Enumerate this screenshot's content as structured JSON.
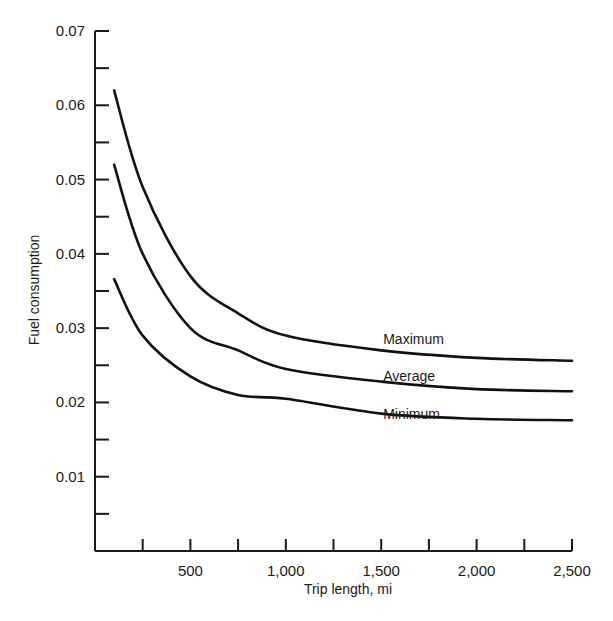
{
  "chart_data": {
    "type": "line",
    "title": "",
    "xlabel": "Trip length, mi",
    "ylabel": "Fuel consumption",
    "xlim": [
      0,
      2500
    ],
    "ylim": [
      0,
      0.07
    ],
    "grid": false,
    "legend": "inline labels at right end of curves",
    "x_ticks": [
      250,
      500,
      750,
      1000,
      1250,
      1500,
      1750,
      2000,
      2250,
      2500
    ],
    "x_tick_labels": [
      {
        "value": 500,
        "label": "500"
      },
      {
        "value": 1000,
        "label": "1,000"
      },
      {
        "value": 1500,
        "label": "1,500"
      },
      {
        "value": 2000,
        "label": "2,000"
      },
      {
        "value": 2500,
        "label": "2,500"
      }
    ],
    "y_ticks": [
      0.005,
      0.01,
      0.015,
      0.02,
      0.025,
      0.03,
      0.035,
      0.04,
      0.045,
      0.05,
      0.055,
      0.06,
      0.065,
      0.07
    ],
    "y_tick_labels": [
      {
        "value": 0.01,
        "label": "0.01"
      },
      {
        "value": 0.02,
        "label": "0.02"
      },
      {
        "value": 0.03,
        "label": "0.03"
      },
      {
        "value": 0.04,
        "label": "0.04"
      },
      {
        "value": 0.05,
        "label": "0.05"
      },
      {
        "value": 0.06,
        "label": "0.06"
      },
      {
        "value": 0.07,
        "label": "0.07"
      }
    ],
    "x": [
      100,
      250,
      500,
      750,
      1000,
      1500,
      2000,
      2500
    ],
    "series": [
      {
        "name": "Maximum",
        "values": [
          0.062,
          0.049,
          0.037,
          0.032,
          0.029,
          0.027,
          0.026,
          0.0256
        ],
        "label_pos": [
          1500,
          0.0285
        ]
      },
      {
        "name": "Average",
        "values": [
          0.052,
          0.04,
          0.03,
          0.027,
          0.0245,
          0.0228,
          0.0218,
          0.0215
        ],
        "label_pos": [
          1500,
          0.0235
        ]
      },
      {
        "name": "Minimum",
        "values": [
          0.0366,
          0.029,
          0.0235,
          0.021,
          0.0205,
          0.0185,
          0.0178,
          0.0176
        ],
        "label_pos": [
          1500,
          0.0185
        ]
      }
    ]
  }
}
